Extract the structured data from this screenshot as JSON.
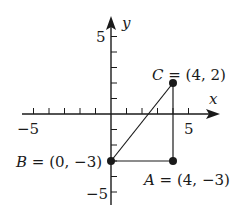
{
  "diagram": {
    "axes": {
      "x_label": "x",
      "y_label": "y",
      "x_tick_label_neg": "−5",
      "x_tick_label_pos": "5",
      "y_tick_label_pos": "5",
      "y_tick_label_neg": "−5",
      "range": [
        -6,
        6
      ]
    },
    "points": [
      {
        "name": "A",
        "coords": "(4, −3)",
        "label": "A = (4, −3)",
        "x": 4,
        "y": -3
      },
      {
        "name": "B",
        "coords": "(0, −3)",
        "label": "B = (0, −3)",
        "x": 0,
        "y": -3
      },
      {
        "name": "C",
        "coords": "(4, 2)",
        "label": "C = (4, 2)",
        "x": 4,
        "y": 2
      }
    ],
    "segments": [
      [
        "B",
        "C"
      ],
      [
        "C",
        "A"
      ],
      [
        "A",
        "B"
      ]
    ],
    "colors": {
      "ink": "#1a1a1a",
      "background": "#ffffff"
    }
  }
}
